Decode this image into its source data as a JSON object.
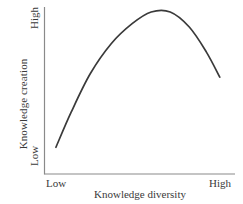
{
  "chart_data": {
    "type": "line",
    "title": "",
    "xlabel": "Knowledge diversity",
    "ylabel": "Knowledge creation",
    "xtick_labels": [
      "Low",
      "High"
    ],
    "ytick_labels": [
      "Low",
      "High"
    ],
    "xlim": [
      0,
      1
    ],
    "ylim": [
      0,
      1
    ],
    "grid": false,
    "legend": "none",
    "annotation": "Inverted U-shaped relationship: knowledge creation rises with knowledge diversity, peaks at moderate diversity, then declines.",
    "series": [
      {
        "name": "Knowledge creation vs. knowledge diversity",
        "color": "#3a3a3a",
        "x": [
          0.06,
          0.14,
          0.24,
          0.35,
          0.46,
          0.56,
          0.66,
          0.76,
          0.85,
          0.92
        ],
        "y": [
          0.16,
          0.37,
          0.6,
          0.78,
          0.9,
          0.97,
          0.97,
          0.88,
          0.73,
          0.58
        ]
      }
    ]
  },
  "axis": {
    "line_color": "#8a8a8a",
    "curve_color": "#3a3a3a"
  }
}
